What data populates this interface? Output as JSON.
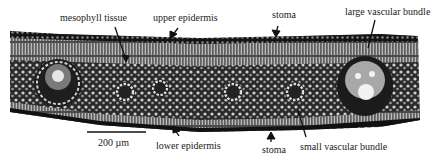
{
  "figure": {
    "labels": {
      "mesophyll": "mesophyll tissue",
      "upper_epidermis": "upper epidermis",
      "stoma_top": "stoma",
      "large_bundle": "large vascular bundle",
      "lower_epidermis": "lower epidermis",
      "stoma_bottom": "stoma",
      "small_bundle": "small vascular bundle"
    },
    "scale_bar": {
      "label": "200 µm"
    },
    "colors": {
      "tissue_dark": "#1a1a1a",
      "tissue_mid": "#6b6b6b",
      "tissue_light": "#d9d9d9",
      "background": "#ffffff",
      "text": "#222222"
    }
  }
}
